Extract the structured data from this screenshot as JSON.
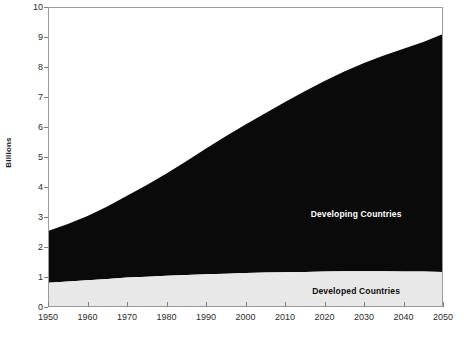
{
  "chart_data": {
    "type": "area",
    "stacked": true,
    "title": "",
    "subtitle": "",
    "xlabel": "",
    "ylabel": "Billions",
    "xlim": [
      1950,
      2050
    ],
    "ylim": [
      0,
      10
    ],
    "ytick_step": 1,
    "xtick_step": 10,
    "grid": false,
    "legend_position": "inline-annotation",
    "xticks": [
      1950,
      1960,
      1970,
      1980,
      1990,
      2000,
      2010,
      2020,
      2030,
      2040,
      2050
    ],
    "yticks": [
      0,
      1,
      2,
      3,
      4,
      5,
      6,
      7,
      8,
      9,
      10
    ],
    "x": [
      1950,
      1955,
      1960,
      1965,
      1970,
      1975,
      1980,
      1985,
      1990,
      1995,
      2000,
      2005,
      2010,
      2015,
      2020,
      2025,
      2030,
      2035,
      2040,
      2045,
      2050
    ],
    "series": [
      {
        "name": "Developed Countries",
        "color": "#e8e8e8",
        "text_color": "#0d0d0d",
        "values": [
          0.81,
          0.85,
          0.89,
          0.93,
          0.98,
          1.01,
          1.04,
          1.07,
          1.09,
          1.11,
          1.13,
          1.15,
          1.16,
          1.17,
          1.18,
          1.19,
          1.19,
          1.19,
          1.18,
          1.18,
          1.17
        ]
      },
      {
        "name": "Developing Countries",
        "color": "#0a0a0a",
        "text_color": "#ffffff",
        "values": [
          1.72,
          1.92,
          2.14,
          2.42,
          2.73,
          3.06,
          3.41,
          3.79,
          4.19,
          4.58,
          4.95,
          5.31,
          5.67,
          6.02,
          6.35,
          6.66,
          6.94,
          7.19,
          7.43,
          7.65,
          7.93
        ]
      }
    ],
    "totals": [
      2.53,
      2.77,
      3.03,
      3.35,
      3.71,
      4.07,
      4.45,
      4.86,
      5.28,
      5.69,
      6.08,
      6.46,
      6.83,
      7.19,
      7.53,
      7.85,
      8.13,
      8.38,
      8.61,
      8.83,
      9.1
    ],
    "annotations": [
      {
        "text": "Developing Countries",
        "x": 2028,
        "y": 3.1,
        "style": "light"
      },
      {
        "text": "Developed Countries",
        "x": 2028,
        "y": 0.55,
        "style": "dark"
      }
    ]
  },
  "style": {
    "plot_border_color": "#9a9a9a",
    "tick_color": "#808080",
    "background": "#ffffff",
    "axis_text_color": "#2b2b2b"
  },
  "geometry": {
    "plot_left": 48,
    "plot_right": 443,
    "plot_top": 7,
    "plot_bottom": 307
  }
}
